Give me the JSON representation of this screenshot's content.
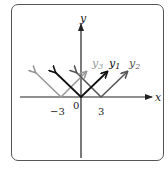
{
  "diagram": {
    "axes": {
      "x_label": "x",
      "y_label": "y",
      "origin_label": "0"
    },
    "ticks": [
      {
        "label": "−3",
        "value": -3
      },
      {
        "label": "3",
        "value": 3
      }
    ],
    "curves": [
      {
        "name": "y1",
        "label_main": "y",
        "label_sub": "1",
        "expression": "|x|",
        "vertex": 0,
        "color": "#111111"
      },
      {
        "name": "y2",
        "label_main": "y",
        "label_sub": "2",
        "expression": "|x-3|",
        "vertex": 3,
        "color": "#555555"
      },
      {
        "name": "y3",
        "label_main": "y",
        "label_sub": "3",
        "expression": "|x+3|",
        "vertex": -3,
        "color": "#999999"
      }
    ]
  }
}
